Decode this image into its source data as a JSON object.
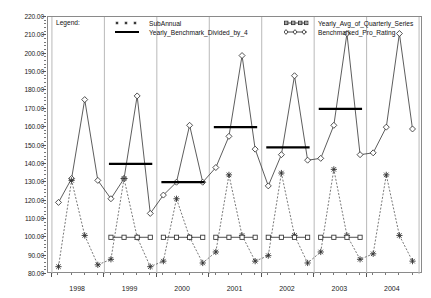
{
  "chart_data": {
    "type": "line",
    "title": "",
    "xlabel": "",
    "ylabel": "",
    "ylim": [
      80,
      220
    ],
    "ytick_step": 10,
    "ytick_labels": [
      "220.00",
      "210.00",
      "200.00",
      "190.00",
      "180.00",
      "170.00",
      "160.00",
      "150.00",
      "140.00",
      "130.00",
      "120.00",
      "110.00",
      "100.00",
      "90.00",
      "80.00"
    ],
    "ytick_values": [
      220,
      210,
      200,
      190,
      180,
      170,
      160,
      150,
      140,
      130,
      120,
      110,
      100,
      90,
      80
    ],
    "xtick_labels": [
      "1998",
      "1999",
      "2000",
      "2001",
      "2002",
      "2003",
      "2004"
    ],
    "xtick_values": [
      1998,
      1999,
      2000,
      2001,
      2002,
      2003,
      2004
    ],
    "x_quarters": [
      "1998Q1",
      "1998Q2",
      "1998Q3",
      "1998Q4",
      "1999Q1",
      "1999Q2",
      "1999Q3",
      "1999Q4",
      "2000Q1",
      "2000Q2",
      "2000Q3",
      "2000Q4",
      "2001Q1",
      "2001Q2",
      "2001Q3",
      "2001Q4",
      "2002Q1",
      "2002Q2",
      "2002Q3",
      "2002Q4",
      "2003Q1",
      "2003Q2",
      "2003Q3",
      "2003Q4",
      "2004Q1",
      "2004Q2",
      "2004Q3",
      "2004Q4"
    ],
    "grid": "vertical-year-boundaries",
    "legend_position": "top-inside",
    "series": [
      {
        "name": "SubAnnual",
        "marker": "asterisk",
        "linestyle": "dashed",
        "color": "#333333",
        "values": [
          84,
          131,
          101,
          85,
          88,
          132,
          100,
          84,
          87,
          121,
          100,
          86,
          92,
          134,
          101,
          87,
          90,
          135,
          101,
          86,
          92,
          137,
          101,
          88,
          91,
          134,
          101,
          87
        ]
      },
      {
        "name": "Benchmarked_Pro_Rating",
        "marker": "diamond",
        "linestyle": "solid",
        "color": "#333333",
        "values": [
          119,
          132,
          175,
          131,
          121,
          132,
          177,
          113,
          123,
          130,
          161,
          130,
          138,
          155,
          199,
          148,
          128,
          145,
          188,
          142,
          143,
          161,
          211,
          145,
          146,
          160,
          211,
          159
        ]
      },
      {
        "name": "Yearly_Benchmark_Divided_by_4",
        "marker": "hline",
        "linestyle": "thick-solid",
        "color": "#000000",
        "segments": [
          {
            "year": "1999",
            "value": 140
          },
          {
            "year": "2000",
            "value": 130
          },
          {
            "year": "2001",
            "value": 160
          },
          {
            "year": "2002",
            "value": 149
          },
          {
            "year": "2003",
            "value": 170
          }
        ]
      },
      {
        "name": "Yearly_Avg_of_Quarterly_Series",
        "marker": "square",
        "linestyle": "solid",
        "color": "#333333",
        "segments": [
          {
            "year": "1999",
            "value": 100
          },
          {
            "year": "2000",
            "value": 100
          },
          {
            "year": "2001",
            "value": 100
          },
          {
            "year": "2002",
            "value": 100
          },
          {
            "year": "2003",
            "value": 100
          }
        ]
      }
    ]
  },
  "legend": {
    "title": "Legend:",
    "entries": [
      {
        "label": "SubAnnual",
        "key": "asterisk-dashed"
      },
      {
        "label": "Yearly_Benchmark_Divided_by_4",
        "key": "thick-line"
      },
      {
        "label": "Yearly_Avg_of_Quarterly_Series",
        "key": "square-line"
      },
      {
        "label": "Benchmarked_Pro_Rating",
        "key": "diamond-line"
      }
    ]
  }
}
